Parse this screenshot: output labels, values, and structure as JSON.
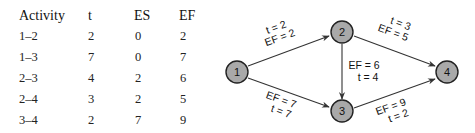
{
  "table": {
    "headers": [
      "Activity",
      "t",
      "ES",
      "EF"
    ],
    "rows": [
      [
        "1–2",
        "2",
        "0",
        "2"
      ],
      [
        "1–3",
        "7",
        "0",
        "7"
      ],
      [
        "2–3",
        "4",
        "2",
        "6"
      ],
      [
        "2–4",
        "3",
        "2",
        "5"
      ],
      [
        "3–4",
        "2",
        "7",
        "9"
      ]
    ]
  },
  "network": {
    "nodes": [
      {
        "id": "1",
        "label": "1"
      },
      {
        "id": "2",
        "label": "2"
      },
      {
        "id": "3",
        "label": "3"
      },
      {
        "id": "4",
        "label": "4"
      }
    ],
    "edges": [
      {
        "from": "1",
        "to": "2",
        "line1": "t = 2",
        "line2": "EF = 2"
      },
      {
        "from": "1",
        "to": "3",
        "line1": "EF = 7",
        "line2": "t = 7"
      },
      {
        "from": "2",
        "to": "3",
        "line1": "EF = 6",
        "line2": "t = 4"
      },
      {
        "from": "2",
        "to": "4",
        "line1": "t = 3",
        "line2": "EF = 5"
      },
      {
        "from": "3",
        "to": "4",
        "line1": "EF = 9",
        "line2": "t = 2"
      }
    ],
    "node_fill": "#a9a9a9",
    "node_stroke": "#222222"
  }
}
